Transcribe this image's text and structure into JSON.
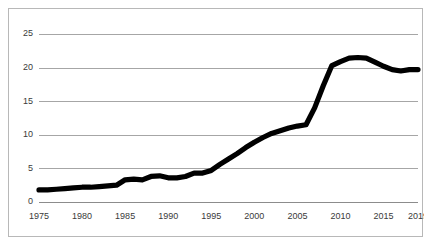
{
  "chart_data": {
    "type": "line",
    "title": "",
    "subtitle": "",
    "xlabel": "",
    "ylabel": "",
    "xlim": [
      1975,
      2019
    ],
    "ylim": [
      0,
      25
    ],
    "grid": "horizontal",
    "legend": "none",
    "series_color": "#000000",
    "gridline_color": "#a6a6a6",
    "border_color": "#b8b8b8",
    "background_color": "#ffffff",
    "y_ticks": [
      0,
      5,
      10,
      15,
      20,
      25
    ],
    "y_tick_labels": [
      "0",
      "5",
      "10",
      "15",
      "20",
      "25"
    ],
    "x_ticks": [
      1975,
      1980,
      1985,
      1990,
      1995,
      2000,
      2005,
      2010,
      2015,
      2019
    ],
    "x_tick_labels": [
      "1975",
      "1980",
      "1985",
      "1990",
      "1995",
      "2000",
      "2005",
      "2010",
      "2015",
      "2019"
    ],
    "series": [
      {
        "name": "value",
        "x": [
          1975,
          1976,
          1977,
          1978,
          1979,
          1980,
          1981,
          1982,
          1983,
          1984,
          1985,
          1986,
          1987,
          1988,
          1989,
          1990,
          1991,
          1992,
          1993,
          1994,
          1995,
          1996,
          1997,
          1998,
          1999,
          2000,
          2001,
          2002,
          2003,
          2004,
          2005,
          2006,
          2007,
          2008,
          2009,
          2010,
          2011,
          2012,
          2013,
          2014,
          2015,
          2016,
          2017,
          2018,
          2019
        ],
        "values": [
          1.8,
          1.8,
          1.9,
          2.0,
          2.1,
          2.2,
          2.2,
          2.3,
          2.4,
          2.5,
          3.3,
          3.4,
          3.3,
          3.8,
          3.9,
          3.6,
          3.6,
          3.8,
          4.3,
          4.3,
          4.7,
          5.6,
          6.4,
          7.2,
          8.1,
          8.9,
          9.6,
          10.2,
          10.6,
          11.0,
          11.3,
          11.5,
          14.0,
          17.3,
          20.3,
          20.9,
          21.4,
          21.5,
          21.4,
          20.8,
          20.2,
          19.7,
          19.5,
          19.7,
          19.7
        ]
      }
    ]
  }
}
